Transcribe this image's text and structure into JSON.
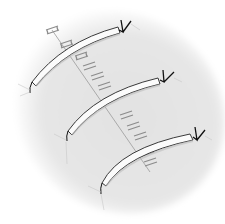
{
  "illustration": {
    "subject": "wound-closure-with-retention-sutures-and-bolsters",
    "colors": {
      "background": "#ffffff",
      "skin": "#e6e6e6",
      "bolster_fill": "#fbfbfb",
      "bolster_stroke": "#3a3a3a",
      "staple": "#8c8c8c",
      "suture": "#111111"
    },
    "bolster_count": 3
  }
}
